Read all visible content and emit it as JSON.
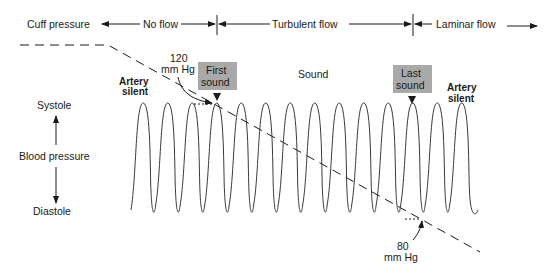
{
  "header": {
    "cuff_pressure": "Cuff pressure",
    "no_flow": "No flow",
    "turbulent_flow": "Turbulent flow",
    "laminar_flow": "Laminar flow"
  },
  "axis": {
    "systole": "Systole",
    "blood_pressure": "Blood pressure",
    "diastole": "Diastole"
  },
  "annotations": {
    "artery_silent_left": [
      "Artery",
      "silent"
    ],
    "artery_silent_right": [
      "Artery",
      "silent"
    ],
    "sound": "Sound",
    "first_sound": [
      "First",
      "sound"
    ],
    "last_sound": [
      "Last",
      "sound"
    ],
    "systolic_value": "120",
    "systolic_unit": "mm Hg",
    "diastolic_value": "80",
    "diastolic_unit": "mm Hg"
  },
  "pressure_wave": {
    "cycles": 14,
    "systolic_mmHg": 120,
    "diastolic_mmHg": 80,
    "first_sound_cycle": 4,
    "last_sound_cycle": 12
  },
  "colors": {
    "ink": "#1a1a1a",
    "box_fill": "#a9a9a9",
    "wave": "#3a3a3a"
  }
}
